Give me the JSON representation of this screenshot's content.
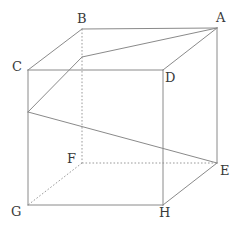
{
  "figure": {
    "kind": "geometry-diagram",
    "canvas": {
      "width": 243,
      "height": 237
    },
    "colors": {
      "background": "#ffffff",
      "solid_edge": "#8a8a8a",
      "hidden_edge": "#9a9a9a",
      "label_text": "#3a3a3a"
    },
    "vertices": [
      {
        "name": "A",
        "label": "A",
        "x": 217,
        "y": 28,
        "label_x": 216,
        "label_y": 11,
        "hidden": false
      },
      {
        "name": "B",
        "label": "B",
        "x": 82,
        "y": 29,
        "label_x": 77,
        "label_y": 12,
        "hidden": false
      },
      {
        "name": "C",
        "label": "C",
        "x": 28,
        "y": 70,
        "label_x": 12,
        "label_y": 60,
        "hidden": false
      },
      {
        "name": "D",
        "label": "D",
        "x": 163,
        "y": 70,
        "label_x": 165,
        "label_y": 71,
        "hidden": false
      },
      {
        "name": "E",
        "label": "E",
        "x": 217,
        "y": 163,
        "label_x": 220,
        "label_y": 164,
        "hidden": false
      },
      {
        "name": "F",
        "label": "F",
        "x": 82,
        "y": 163,
        "label_x": 67,
        "label_y": 152,
        "hidden": true
      },
      {
        "name": "G",
        "label": "G",
        "x": 28,
        "y": 205,
        "label_x": 11,
        "label_y": 205,
        "hidden": false
      },
      {
        "name": "H",
        "label": "H",
        "x": 163,
        "y": 205,
        "label_x": 159,
        "label_y": 206,
        "hidden": false
      }
    ],
    "interior_points": [
      {
        "name": "P",
        "x": 82,
        "y": 57
      },
      {
        "name": "Q",
        "x": 28,
        "y": 112
      }
    ],
    "solid_edges": [
      {
        "from": "B",
        "to": "A",
        "x1": 82,
        "y1": 29,
        "x2": 217,
        "y2": 28
      },
      {
        "from": "C",
        "to": "B",
        "x1": 28,
        "y1": 70,
        "x2": 82,
        "y2": 29
      },
      {
        "from": "C",
        "to": "D",
        "x1": 28,
        "y1": 70,
        "x2": 163,
        "y2": 70
      },
      {
        "from": "D",
        "to": "A",
        "x1": 163,
        "y1": 70,
        "x2": 217,
        "y2": 28
      },
      {
        "from": "C",
        "to": "G",
        "x1": 28,
        "y1": 70,
        "x2": 28,
        "y2": 205
      },
      {
        "from": "D",
        "to": "H",
        "x1": 163,
        "y1": 70,
        "x2": 163,
        "y2": 205
      },
      {
        "from": "A",
        "to": "E",
        "x1": 217,
        "y1": 28,
        "x2": 217,
        "y2": 163
      },
      {
        "from": "G",
        "to": "H",
        "x1": 28,
        "y1": 205,
        "x2": 163,
        "y2": 205
      },
      {
        "from": "H",
        "to": "E",
        "x1": 163,
        "y1": 205,
        "x2": 217,
        "y2": 163
      },
      {
        "from": "A",
        "to": "P",
        "x1": 217,
        "y1": 28,
        "x2": 82,
        "y2": 57
      },
      {
        "from": "P",
        "to": "Q",
        "x1": 82,
        "y1": 57,
        "x2": 28,
        "y2": 112
      },
      {
        "from": "Q",
        "to": "E",
        "x1": 28,
        "y1": 112,
        "x2": 217,
        "y2": 163
      }
    ],
    "hidden_edges": [
      {
        "from": "B",
        "to": "F",
        "x1": 82,
        "y1": 29,
        "x2": 82,
        "y2": 163
      },
      {
        "from": "F",
        "to": "E",
        "x1": 82,
        "y1": 163,
        "x2": 217,
        "y2": 163
      },
      {
        "from": "F",
        "to": "G",
        "x1": 82,
        "y1": 163,
        "x2": 28,
        "y2": 205
      }
    ]
  }
}
